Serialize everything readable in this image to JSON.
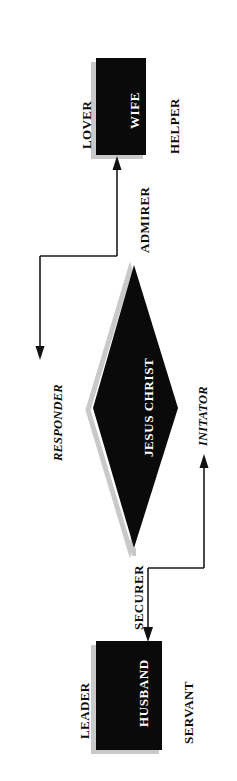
{
  "diagram": {
    "orientation": "rotated-90-clockwise",
    "colors": {
      "node_fill": "#0a0a0a",
      "node_text": "#ffffff",
      "shadow": "#c9c9c9",
      "line": "#1a1a1a",
      "background": "#ffffff"
    },
    "nodes": [
      {
        "id": "wife",
        "label": "WIFE",
        "shape": "rectangle"
      },
      {
        "id": "jesus",
        "label": "JESUS CHRIST",
        "shape": "diamond"
      },
      {
        "id": "husband",
        "label": "HUSBAND",
        "shape": "rectangle"
      }
    ],
    "node_roles": {
      "wife_left": "LOVER",
      "wife_right": "HELPER",
      "husband_left": "LEADER",
      "husband_right": "SERVANT"
    },
    "edges": [
      {
        "id": "admirer",
        "label": "ADMIRER",
        "from": "jesus",
        "to": "wife",
        "style": "bold"
      },
      {
        "id": "responder",
        "label": "RESPONDER",
        "from": "admirer-line",
        "to": "open",
        "style": "italic"
      },
      {
        "id": "initator",
        "label": "INITATOR",
        "from": "securer-line",
        "to": "open",
        "style": "italic"
      },
      {
        "id": "securer",
        "label": "SECURER",
        "from": "jesus",
        "to": "husband",
        "style": "bold"
      }
    ]
  }
}
